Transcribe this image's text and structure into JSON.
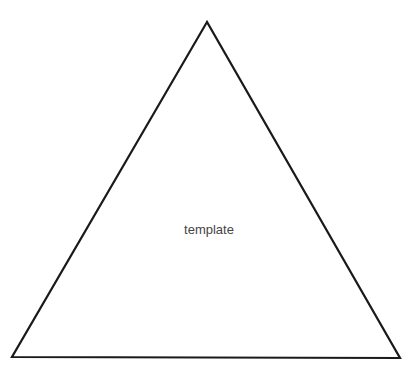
{
  "diagram": {
    "shape": "triangle",
    "label": "template",
    "stroke_color": "#1a1a1a",
    "fill_color": "#ffffff",
    "vertices": [
      [
        207,
        22
      ],
      [
        12,
        357
      ],
      [
        400,
        358
      ]
    ]
  }
}
